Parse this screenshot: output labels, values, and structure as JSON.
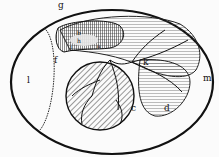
{
  "figure": {
    "labels": {
      "g": "g",
      "b": "b",
      "h": "h",
      "i": "i",
      "a": "a",
      "f": "f",
      "l": "l",
      "k": "k",
      "m": "m",
      "c": "c",
      "d": "d"
    },
    "colors": {
      "ink": "#111111",
      "paper": "#fbfbfb"
    }
  }
}
